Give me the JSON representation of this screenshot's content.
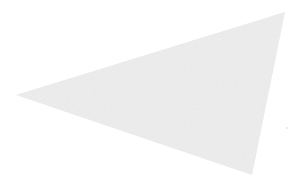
{
  "image": {
    "width": 293,
    "height": 185,
    "background": "#ffffff"
  },
  "shape": {
    "kind": "speckled-triangle",
    "vertices": [
      [
        16,
        95
      ],
      [
        285,
        12
      ],
      [
        252,
        175
      ]
    ],
    "base_color": "#ececec",
    "speckle_dark": "#c8c8c8",
    "speckle_light": "#f7f7f7"
  },
  "stray_speck": {
    "x": 287,
    "y": 128,
    "color": "#d0d0d0"
  }
}
